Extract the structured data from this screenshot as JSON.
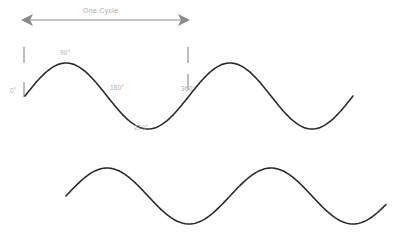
{
  "diagram": {
    "background_color": "#ffffff",
    "wave_color": "#2b2b2b",
    "annotation_color": "#8a8a8a",
    "label_color": "#b0b0b0",
    "cycle_annotation": {
      "label": "One Cycle",
      "arrow_style": "double-headed",
      "x_start": 22,
      "x_end": 189,
      "y": 20
    },
    "axis_labels": [
      {
        "text": "0°",
        "x": 10,
        "y": 88,
        "degrees": 0
      },
      {
        "text": "90°",
        "x": 60,
        "y": 50,
        "degrees": 90
      },
      {
        "text": "180°",
        "x": 110,
        "y": 85,
        "degrees": 180
      },
      {
        "text": "270°",
        "x": 134,
        "y": 125,
        "degrees": 270
      },
      {
        "text": "360°",
        "x": 181,
        "y": 86,
        "degrees": 360
      }
    ],
    "tick_marks": [
      {
        "x": 24,
        "y1": 47,
        "y2": 63
      },
      {
        "x": 24,
        "y1": 82,
        "y2": 97
      },
      {
        "x": 188,
        "y1": 47,
        "y2": 63
      },
      {
        "x": 188,
        "y1": 74,
        "y2": 90
      }
    ],
    "waves": [
      {
        "name": "upper-sine-wave",
        "baseline_y": 96,
        "amplitude": 33,
        "period": 164,
        "x_start": 25,
        "x_end": 353,
        "cycles": 2,
        "path": "M 25 100 C 30 82 38 66 50 62 C 62 58 70 62 78 72 C 88 84 96 92 106 96 C 116 100 124 104 132 114 C 139 122 143 125 150 124 C 160 123 168 114 176 102 C 182 93 186 86 189 80 C 195 68 202 62 213 60 C 225 58 233 62 241 72 C 251 84 259 92 269 96 C 279 100 287 104 295 114 C 302 122 306 125 313 124 C 323 123 331 114 339 102 C 345 93 349 86 353 78"
      },
      {
        "name": "lower-sine-wave",
        "baseline_y": 196,
        "amplitude": 28,
        "period": 164,
        "x_start": 66,
        "x_end": 386,
        "cycles": 2,
        "path": "M 66 202 C 72 186 80 174 91 170 C 101 167 110 171 118 181 C 127 192 135 199 145 203 C 155 207 163 210 171 218 C 178 224 183 226 190 224 C 200 221 208 212 216 200 C 222 191 226 184 230 178 C 236 168 244 162 254 161 C 265 160 273 165 281 175 C 290 187 298 195 308 199 C 318 203 326 207 334 215 C 341 221 346 223 353 221 C 363 218 371 209 379 197 C 383 192 385 188 386 186"
      }
    ]
  }
}
